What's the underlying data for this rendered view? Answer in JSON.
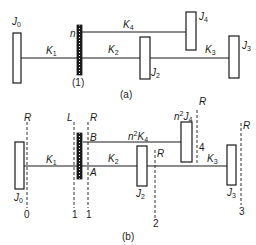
{
  "diagram_a": {
    "caption": "(a)",
    "gear_label": "n",
    "gear_index": "(1)",
    "inertias": [
      {
        "name": "J",
        "sub": "0"
      },
      {
        "name": "J",
        "sub": "2"
      },
      {
        "name": "J",
        "sub": "3"
      },
      {
        "name": "J",
        "sub": "4"
      }
    ],
    "stiffnesses": [
      {
        "name": "K",
        "sub": "1"
      },
      {
        "name": "K",
        "sub": "2"
      },
      {
        "name": "K",
        "sub": "3"
      },
      {
        "name": "K",
        "sub": "4"
      }
    ]
  },
  "diagram_b": {
    "caption": "(b)",
    "inertias": [
      {
        "name": "J",
        "sub": "0"
      },
      {
        "name": "J",
        "sub": "2"
      },
      {
        "name": "J",
        "sub": "3"
      },
      {
        "prefix": "n",
        "sup": "2",
        "name": "J",
        "sub": "4"
      }
    ],
    "stiffnesses": [
      {
        "name": "K",
        "sub": "1"
      },
      {
        "name": "K",
        "sub": "2"
      },
      {
        "name": "K",
        "sub": "3"
      },
      {
        "prefix": "n",
        "sup": "2",
        "name": "K",
        "sub": "4"
      }
    ],
    "points": {
      "A": "A",
      "B": "B"
    },
    "reference_lines": [
      {
        "top": "R",
        "bottom": "0"
      },
      {
        "top": "L",
        "bottom": "1"
      },
      {
        "top": "R",
        "bottom": "1"
      },
      {
        "top": "R",
        "bottom": "2"
      },
      {
        "top": "R",
        "bottom": "4"
      },
      {
        "top": "R",
        "bottom": "3"
      }
    ]
  },
  "colors": {
    "ink": "#1a1a1a",
    "background": "#ffffff"
  }
}
